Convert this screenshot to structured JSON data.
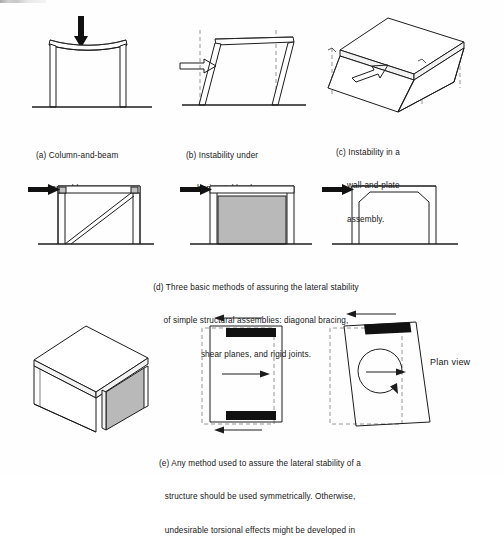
{
  "figure": {
    "panels": [
      {
        "id": "a",
        "label": "(a)",
        "caption_line1": "(a) Column-and-beam",
        "caption_line2": "assembly.",
        "diagram_name": "column-and-beam-assembly",
        "annotations": {
          "load_arrow": "vertical-load-arrow-down"
        }
      },
      {
        "id": "b",
        "label": "(b)",
        "caption_line1": "(b) Instability under",
        "caption_line2": "horizontal loads.",
        "diagram_name": "racked-frame-under-horizontal-load",
        "annotations": {
          "load_arrow": "horizontal-load-arrow-right",
          "reference": "dashed-plumb-lines"
        }
      },
      {
        "id": "c",
        "label": "(c)",
        "caption_line1": "(c) Instability in a",
        "caption_line2": "wall-and-plate",
        "caption_line3": "assembly.",
        "diagram_name": "wall-and-plate-assembly-racked",
        "annotations": {
          "load_arrow": "horizontal-load-arrow-outline",
          "reference": "dashed-plumb-lines"
        }
      },
      {
        "id": "d",
        "label": "(d)",
        "caption_line1": "(d) Three basic methods of assuring the lateral stability",
        "caption_line2": "of simple structural assemblies: diagonal bracing,",
        "caption_line3": "shear planes, and rigid joints.",
        "methods": [
          {
            "name": "diagonal-bracing",
            "diagram_name": "frame-with-diagonal-brace"
          },
          {
            "name": "shear-planes",
            "diagram_name": "frame-with-shear-panel"
          },
          {
            "name": "rigid-joints",
            "diagram_name": "frame-with-rigid-haunched-joints"
          }
        ]
      },
      {
        "id": "e",
        "label": "(e)",
        "caption_line1": "(e) Any method used to assure the lateral stability of a",
        "caption_line2": "structure should be used symmetrically. Otherwise,",
        "caption_line3": "undesirable torsional effects might be developed in",
        "sub_figures": [
          {
            "name": "box-with-single-shear-wall",
            "diagram_name": "axonometric-box-one-gray-shear-wall"
          },
          {
            "name": "symmetric-plan",
            "diagram_name": "plan-two-opposite-shear-walls-translation"
          },
          {
            "name": "torsional-plan",
            "diagram_name": "plan-single-shear-wall-rotation"
          }
        ],
        "plan_view_label": "Plan view"
      }
    ]
  },
  "colors": {
    "ink": "#1c1c1c",
    "shear_panel_gray": "#b9b9b9",
    "shear_wall_black": "#111111",
    "dashed_reference": "#8a8a8a",
    "paper": "#fefefe"
  }
}
